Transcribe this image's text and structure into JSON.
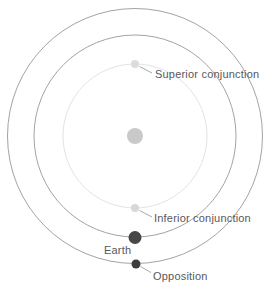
{
  "diagram": {
    "labels": {
      "superior_conjunction": "Superior conjunction",
      "inferior_conjunction": "Inferior conjunction",
      "earth": "Earth",
      "opposition": "Opposition"
    },
    "colors": {
      "background": "#ffffff",
      "orbit_stroke": "#a3a3a3",
      "inner_orbit_stroke": "#e3e3e3",
      "sun_fill": "#c9c9c9",
      "superior_dot_fill": "#dcdcdc",
      "inferior_dot_fill": "#d8d8d8",
      "earth_dot_fill": "#474747",
      "opposition_dot_fill": "#3c3c3c",
      "leader_line": "#a8a8a8",
      "label_text": "#58585a"
    }
  }
}
